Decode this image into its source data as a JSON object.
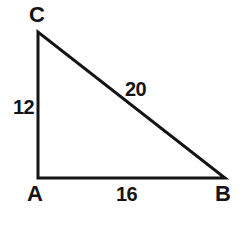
{
  "figure": {
    "background_color": "#ffffff",
    "stroke_color": "#141414",
    "text_color": "#141414",
    "stroke_width": 3,
    "width": 250,
    "height": 234
  },
  "vertices": {
    "C": {
      "label": "C",
      "x": 38,
      "y": 32
    },
    "A": {
      "label": "A",
      "x": 38,
      "y": 178
    },
    "B": {
      "label": "B",
      "x": 225,
      "y": 178
    }
  },
  "sides": {
    "leg_vertical": {
      "label": "12",
      "from": "A",
      "to": "C"
    },
    "leg_horizontal": {
      "label": "16",
      "from": "A",
      "to": "B"
    },
    "hypotenuse": {
      "label": "20",
      "from": "C",
      "to": "B"
    }
  },
  "chart_data": {
    "type": "diagram",
    "shape": "right-triangle",
    "vertex_labels": [
      "C",
      "A",
      "B"
    ],
    "vertex_points": [
      [
        38,
        32
      ],
      [
        38,
        178
      ],
      [
        225,
        178
      ]
    ],
    "right_angle_at": "A",
    "side_labels": [
      "12",
      "16",
      "20"
    ],
    "side_values": [
      12,
      16,
      20
    ],
    "side_descriptions": [
      "AC = 12 (vertical leg)",
      "AB = 16 (horizontal leg)",
      "CB = 20 (hypotenuse)"
    ],
    "annotations": [
      "12",
      "16",
      "20",
      "A",
      "B",
      "C"
    ]
  }
}
